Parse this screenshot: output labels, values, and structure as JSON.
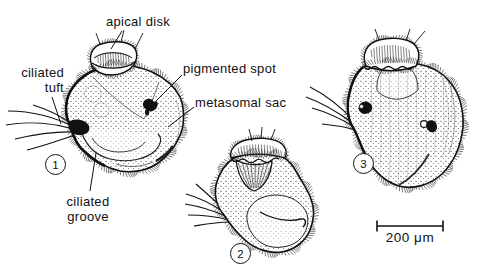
{
  "figure": {
    "background": "#ffffff",
    "ink": "#111111",
    "labels": {
      "apical_disk": "apical disk",
      "ciliated_tuft": "ciliated\ntuft",
      "pigmented_spot": "pigmented spot",
      "metasomal_sac": "metasomal sac",
      "ciliated_groove": "ciliated\ngroove"
    },
    "stages": [
      {
        "number": "1"
      },
      {
        "number": "2"
      },
      {
        "number": "3"
      }
    ],
    "scale_bar": {
      "label": "200 μm"
    }
  }
}
